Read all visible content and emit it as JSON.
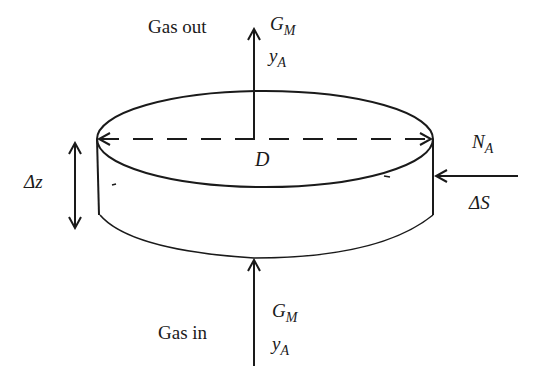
{
  "diagram": {
    "colors": {
      "stroke": "#1a1a1a",
      "background": "#ffffff"
    },
    "labels": {
      "gas_out": "Gas out",
      "gas_in": "Gas in",
      "top_flow": {
        "symbol": "G",
        "subscript": "M"
      },
      "top_mole_fraction": {
        "symbol": "y",
        "subscript": "A"
      },
      "bottom_flow": {
        "symbol": "G",
        "subscript": "M"
      },
      "bottom_mole_fraction": {
        "symbol": "y",
        "subscript": "A"
      },
      "diameter": "D",
      "height": "Δz",
      "flux": {
        "symbol": "N",
        "subscript": "A"
      },
      "area": "ΔS"
    },
    "arrows": [
      {
        "name": "gas-out-arrow",
        "direction": "up"
      },
      {
        "name": "gas-in-arrow",
        "direction": "up"
      },
      {
        "name": "flux-arrow",
        "direction": "left"
      },
      {
        "name": "height-arrow",
        "direction": "both-vertical"
      },
      {
        "name": "diameter-arrow",
        "direction": "both-horizontal",
        "style": "dashed"
      }
    ]
  }
}
